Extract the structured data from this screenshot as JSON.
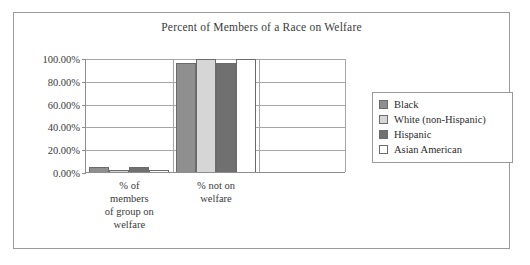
{
  "chart_data": {
    "type": "bar",
    "title": "Percent of Members of a Race on Welfare",
    "xlabel": "",
    "ylabel": "",
    "ylim": [
      0,
      100
    ],
    "grid": true,
    "legend_position": "right",
    "categories": [
      "% of\nmembers\nof group on\nwelfare",
      "% not on\nwelfare"
    ],
    "category_lines": [
      [
        "% of",
        "members",
        "of group on",
        "welfare"
      ],
      [
        "% not on",
        "welfare"
      ]
    ],
    "ytick_labels": [
      "100.00%",
      "80.00%",
      "60.00%",
      "40.00%",
      "20.00%",
      "0.00%"
    ],
    "ytick_values": [
      100,
      80,
      60,
      40,
      20,
      0
    ],
    "series": [
      {
        "name": "Black",
        "color": "#8f8f8f",
        "values": [
          4.5,
          95.5
        ]
      },
      {
        "name": "White (non-Hispanic)",
        "color": "#d6d6d6",
        "values": [
          1.2,
          98.8
        ]
      },
      {
        "name": "Hispanic",
        "color": "#707070",
        "values": [
          4.0,
          96.0
        ]
      },
      {
        "name": "Asian American",
        "color": "#ffffff",
        "values": [
          1.0,
          99.0
        ]
      }
    ]
  },
  "legend": {
    "items": [
      {
        "label": "Black"
      },
      {
        "label": "White (non-Hispanic)"
      },
      {
        "label": "Hispanic"
      },
      {
        "label": "Asian American"
      }
    ]
  }
}
